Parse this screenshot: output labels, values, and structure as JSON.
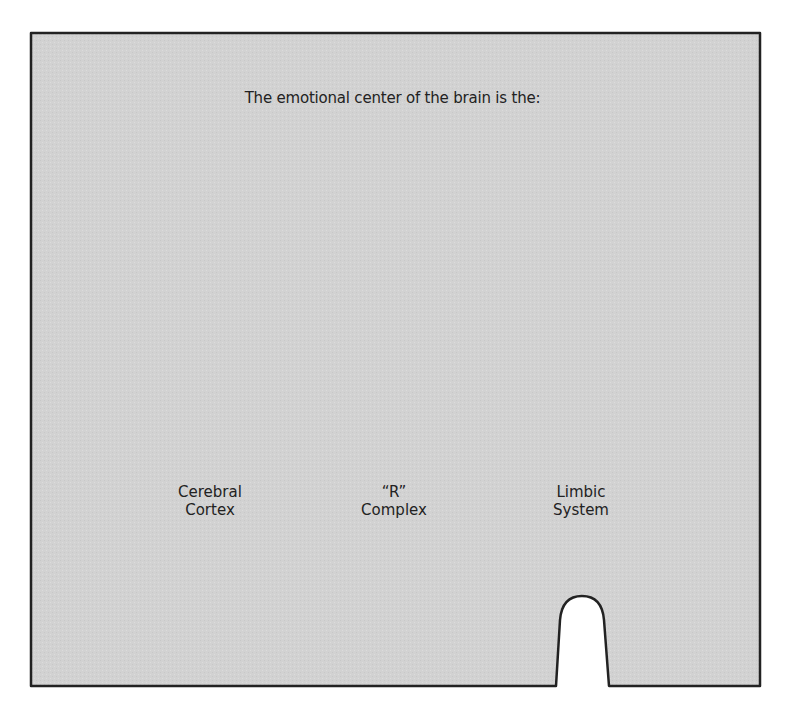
{
  "question": "The emotional center of the brain is the:",
  "options": [
    {
      "line1": "Cerebral",
      "line2": "Cortex"
    },
    {
      "line1": "“R”",
      "line2": "Complex"
    },
    {
      "line1": "Limbic",
      "line2": "System"
    }
  ],
  "colors": {
    "card_fill": "#d4d4d4",
    "border": "#222222",
    "background": "#ffffff"
  }
}
